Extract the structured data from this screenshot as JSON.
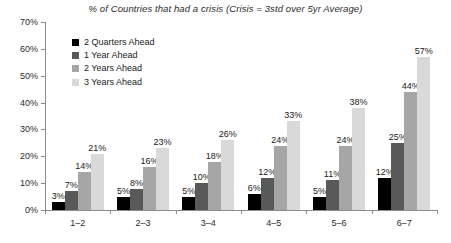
{
  "chart_data": {
    "type": "bar",
    "title": "% of Countries that had a crisis (Crisis = 3std over 5yr Average)",
    "xlabel": "",
    "ylabel": "",
    "ylim": [
      0,
      70
    ],
    "ytick_step": 10,
    "ytick_labels": [
      "0%",
      "10%",
      "20%",
      "30%",
      "40%",
      "50%",
      "60%",
      "70%"
    ],
    "ytick_values": [
      0,
      10,
      20,
      30,
      40,
      50,
      60,
      70
    ],
    "grid": false,
    "legend_position": "upper-left-inside",
    "categories": [
      "1–2",
      "2–3",
      "3–4",
      "4–5",
      "5–6",
      "6–7"
    ],
    "series": [
      {
        "name": "2 Quarters Ahead",
        "color": "#000000",
        "values": [
          3,
          5,
          5,
          6,
          5,
          12
        ],
        "labels": [
          "3%",
          "5%",
          "5%",
          "6%",
          "5%",
          "12%"
        ]
      },
      {
        "name": "1 Year Ahead",
        "color": "#595959",
        "values": [
          7,
          8,
          10,
          12,
          11,
          25
        ],
        "labels": [
          "7%",
          "8%",
          "10%",
          "12%",
          "11%",
          "25%"
        ]
      },
      {
        "name": "2 Years Ahead",
        "color": "#a6a6a6",
        "values": [
          14,
          16,
          18,
          24,
          24,
          44
        ],
        "labels": [
          "14%",
          "16%",
          "18%",
          "24%",
          "24%",
          "44%"
        ]
      },
      {
        "name": "3 Years Ahead",
        "color": "#d9d9d9",
        "values": [
          21,
          23,
          26,
          33,
          38,
          57
        ],
        "labels": [
          "21%",
          "23%",
          "26%",
          "33%",
          "38%",
          "57%"
        ]
      }
    ]
  },
  "axis_color": "#8c8c8c",
  "text_color": "#1a1a1a"
}
